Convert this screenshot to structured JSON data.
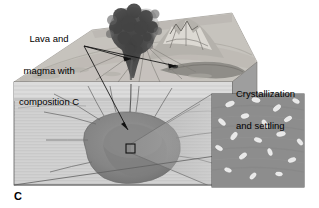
{
  "figure": {
    "panel_letter": "C",
    "type": "geologic-block-diagram",
    "palette": {
      "background": "#ffffff",
      "text": "#000000",
      "top_surface": "#c9c6c0",
      "cross_section": "#cfcfcf",
      "cross_section_upper": "#dadada",
      "side_face": "#9e9e9e",
      "magma_chamber": "#8a8a8a",
      "magma_chamber_dark": "#6f6f6f",
      "magma_core": "#7d7d7d",
      "ash_plume": "#4a4a4a",
      "mountain": "#b5b2ac",
      "lava_flow": "#8f8d88",
      "inset_background": "#8d8d8d",
      "crystal": "#e8e8e8",
      "line": "#1a1a1a",
      "dike": "#6b6b6b"
    }
  },
  "labels": {
    "lava_magma": {
      "line1": "Lava and",
      "line2": "magma with",
      "line3": "composition C"
    },
    "crystallization": {
      "line1": "Crystallization",
      "line2": "and settling"
    }
  },
  "annotations": {
    "leader_arrows": [
      {
        "name": "arrow-to-vent",
        "target": "volcano vent / eruption column"
      },
      {
        "name": "arrow-to-lava-flow",
        "target": "surface lava flow"
      },
      {
        "name": "arrow-to-magma-chamber",
        "target": "subsurface magma chamber"
      }
    ],
    "callout_box": {
      "name": "magma-sample-box",
      "target": "inset detail of crystallizing magma"
    }
  },
  "scene": {
    "surface_features": [
      "ash plume",
      "stratovolcano cone",
      "lava flow",
      "radial valleys"
    ],
    "subsurface_features": [
      "magma chamber",
      "dikes",
      "sills",
      "layered country rock"
    ],
    "inset_features": [
      "suspended plagioclase crystals",
      "settling crystals"
    ]
  }
}
